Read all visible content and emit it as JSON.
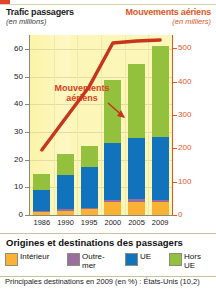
{
  "header": {
    "left_title": "Trafic passagers",
    "left_subtitle": "(en millions)",
    "right_title": "Mouvements aériens",
    "right_subtitle": "(en milliers)"
  },
  "annotation": {
    "line1": "Mouvements",
    "line2": "aériens"
  },
  "legend": {
    "title": "Origines et destinations des passagers",
    "items": [
      {
        "label": "Intérieur",
        "color": "#f9b233"
      },
      {
        "label": "Outre-mer",
        "color": "#9b6ea0"
      },
      {
        "label": "UE",
        "color": "#1273bd"
      },
      {
        "label": "Hors UE",
        "color": "#93c13d"
      }
    ]
  },
  "footnote": "Principales destinations en 2009 (en %) : États-Unis (10,2)",
  "colors": {
    "accent_red": "#d9401f",
    "axis_orange": "#e0561f",
    "plot_bg": "#fcf6b8",
    "interieur": "#f9b233",
    "outremer": "#9b6ea0",
    "ue": "#1273bd",
    "hors_ue": "#93c13d"
  },
  "chart_data": {
    "type": "bar",
    "xlabel": "",
    "ylabel": "Trafic passagers (en millions)",
    "y2label": "Mouvements aériens (en milliers)",
    "categories": [
      "1986",
      "1990",
      "1995",
      "2000",
      "2005",
      "2009"
    ],
    "ylim": [
      0,
      65
    ],
    "yticks": [
      0,
      10,
      20,
      30,
      40,
      50,
      60
    ],
    "y2lim": [
      0,
      540
    ],
    "y2ticks": [
      0,
      100,
      200,
      300,
      400,
      500
    ],
    "grid": true,
    "legend_position": "below",
    "series": [
      {
        "name": "Intérieur",
        "type": "bar-segment",
        "color": "#f9b233",
        "values": [
          1.2,
          1.6,
          2.0,
          4.6,
          4.8,
          4.6
        ]
      },
      {
        "name": "Outre-mer",
        "type": "bar-segment",
        "color": "#9b6ea0",
        "values": [
          0.4,
          0.5,
          0.6,
          0.8,
          0.9,
          0.9
        ]
      },
      {
        "name": "UE",
        "type": "bar-segment",
        "color": "#1273bd",
        "values": [
          7.4,
          12.4,
          14.6,
          20.6,
          22.0,
          22.5
        ]
      },
      {
        "name": "Hors UE",
        "type": "bar-segment",
        "color": "#93c13d",
        "values": [
          5.8,
          7.7,
          7.9,
          22.6,
          27.0,
          33.0
        ]
      },
      {
        "name": "Mouvements aériens",
        "type": "line",
        "color": "#c6351c",
        "axis": "y2",
        "values": [
          195,
          290,
          385,
          516,
          522,
          525
        ]
      }
    ],
    "totals": [
      14.8,
      22.2,
      25.1,
      48.6,
      54.7,
      61.0
    ]
  }
}
